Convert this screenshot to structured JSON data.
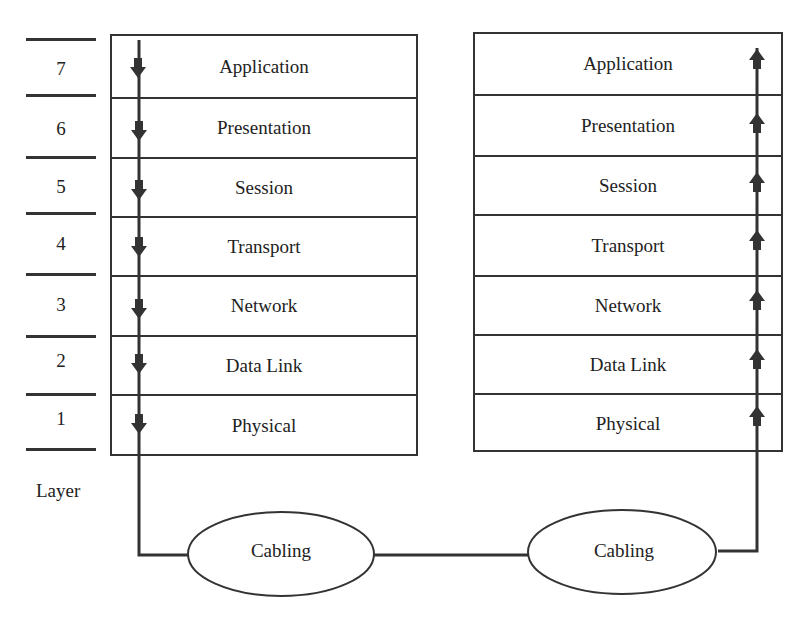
{
  "diagram": {
    "type": "OSI model data flow",
    "layer_caption": "Layer",
    "layer_numbers": [
      "7",
      "6",
      "5",
      "4",
      "3",
      "2",
      "1"
    ],
    "sender_stack": {
      "layers": [
        "Application",
        "Presentation",
        "Session",
        "Transport",
        "Network",
        "Data Link",
        "Physical"
      ],
      "flow_direction": "down"
    },
    "receiver_stack": {
      "layers": [
        "Application",
        "Presentation",
        "Session",
        "Transport",
        "Network",
        "Data Link",
        "Physical"
      ],
      "flow_direction": "up"
    },
    "media": [
      {
        "label": "Cabling"
      },
      {
        "label": "Cabling"
      }
    ],
    "colors": {
      "line": "#333333",
      "background": "#ffffff"
    }
  }
}
